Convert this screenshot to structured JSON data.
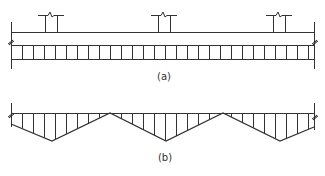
{
  "figure": {
    "stroke_color": "#333333",
    "background": "#ffffff",
    "panel_a": {
      "caption": "(a)",
      "description": "Continuous slab over column supports with uniform distributed band",
      "slab_top_y": 32,
      "left_x": 11,
      "right_x": 314,
      "band": {
        "top_y": 45,
        "bottom_y": 59,
        "hatch_spacing": 11
      },
      "columns": [
        {
          "x_left": 45,
          "x_right": 57,
          "cap_left": 38,
          "cap_right": 64,
          "top_y": 15
        },
        {
          "x_left": 158,
          "x_right": 170,
          "cap_left": 151,
          "cap_right": 177,
          "top_y": 15
        },
        {
          "x_left": 273,
          "x_right": 285,
          "cap_left": 266,
          "cap_right": 292,
          "top_y": 15
        }
      ]
    },
    "panel_b": {
      "caption": "(b)",
      "description": "Triangular (sawtooth) distribution diagram below baseline",
      "baseline_y": 113,
      "valley_y": 141,
      "points": [
        [
          11,
          124
        ],
        [
          52,
          141
        ],
        [
          110,
          113
        ],
        [
          166,
          141
        ],
        [
          223,
          113
        ],
        [
          280,
          141
        ],
        [
          314,
          127
        ]
      ],
      "hatch_spacing": 11
    }
  }
}
